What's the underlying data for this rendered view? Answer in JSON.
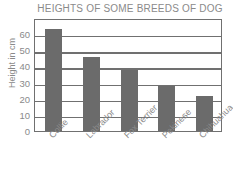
{
  "chart_data": {
    "type": "bar",
    "title": "HEIGHTS OF SOME BREEDS OF DOG",
    "xlabel": "",
    "ylabel": "Height in cm",
    "categories": [
      "Collie",
      "Labrador",
      "Fox Terrier",
      "Pekinese",
      "Chihuahua"
    ],
    "values": [
      63,
      46,
      38,
      28,
      22
    ],
    "ylim": [
      0,
      70
    ],
    "yticks": [
      0,
      10,
      20,
      30,
      40,
      50,
      60
    ],
    "ytick_labels": [
      "0",
      "10",
      "20",
      "30",
      "40",
      "50",
      "60"
    ],
    "grid": true,
    "grid_axis": "y",
    "legend": false,
    "bar_color": "#6b6b6b",
    "axis_color": "#707070",
    "text_color": "#8a8a8a",
    "background_color": "#ffffff"
  },
  "axis": {
    "y_title": "Height in cm"
  }
}
